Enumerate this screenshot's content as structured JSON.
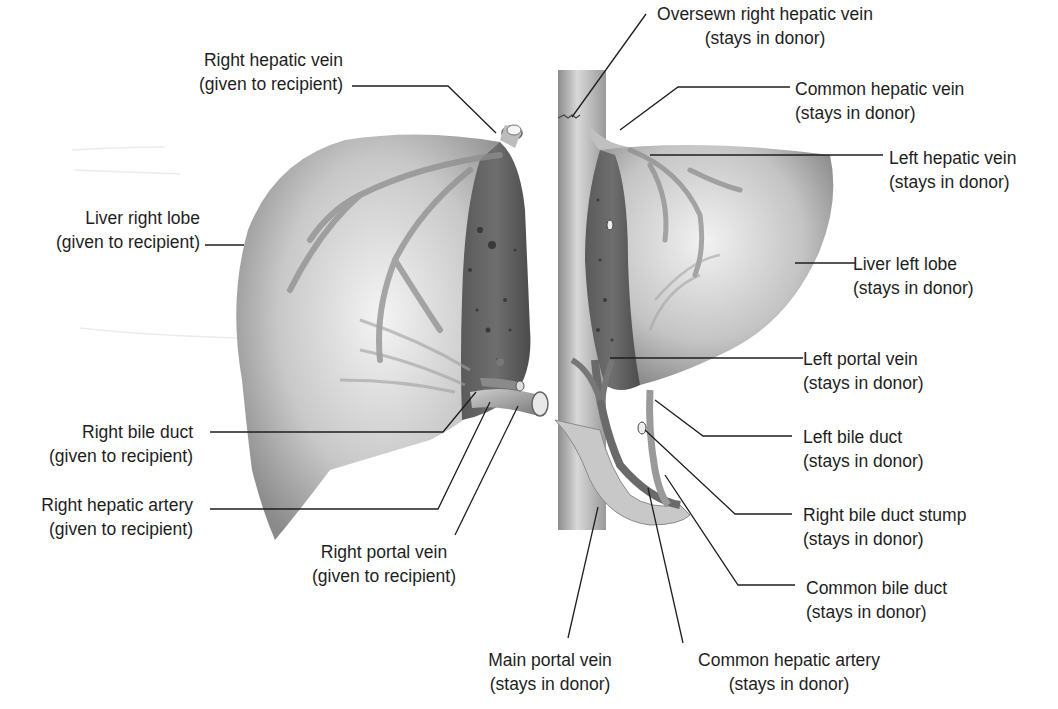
{
  "diagram": {
    "type": "anatomical illustration",
    "labels": [
      {
        "id": "right_hepatic_vein",
        "line1": "Right hepatic vein",
        "line2": "(given to recipient)"
      },
      {
        "id": "liver_right_lobe",
        "line1": "Liver right lobe",
        "line2": "(given to recipient)"
      },
      {
        "id": "right_bile_duct",
        "line1": "Right bile duct",
        "line2": "(given to recipient)"
      },
      {
        "id": "right_hepatic_artery",
        "line1": "Right hepatic artery",
        "line2": "(given to recipient)"
      },
      {
        "id": "right_portal_vein",
        "line1": "Right portal vein",
        "line2": "(given to recipient)"
      },
      {
        "id": "oversewn_right_hepatic_vein",
        "line1": "Oversewn right hepatic vein",
        "line2": "(stays in donor)"
      },
      {
        "id": "common_hepatic_vein",
        "line1": "Common hepatic vein",
        "line2": "(stays in donor)"
      },
      {
        "id": "left_hepatic_vein",
        "line1": "Left hepatic vein",
        "line2": "(stays in donor)"
      },
      {
        "id": "liver_left_lobe",
        "line1": "Liver left lobe",
        "line2": "(stays in donor)"
      },
      {
        "id": "left_portal_vein",
        "line1": "Left portal vein",
        "line2": "(stays in donor)"
      },
      {
        "id": "left_bile_duct",
        "line1": "Left bile duct",
        "line2": "(stays in donor)"
      },
      {
        "id": "right_bile_duct_stump",
        "line1": "Right bile duct stump",
        "line2": "(stays in donor)"
      },
      {
        "id": "common_bile_duct",
        "line1": "Common bile duct",
        "line2": "(stays in donor)"
      },
      {
        "id": "main_portal_vein",
        "line1": "Main portal vein",
        "line2": "(stays in donor)"
      },
      {
        "id": "common_hepatic_artery",
        "line1": "Common hepatic artery",
        "line2": "(stays in donor)"
      }
    ]
  }
}
